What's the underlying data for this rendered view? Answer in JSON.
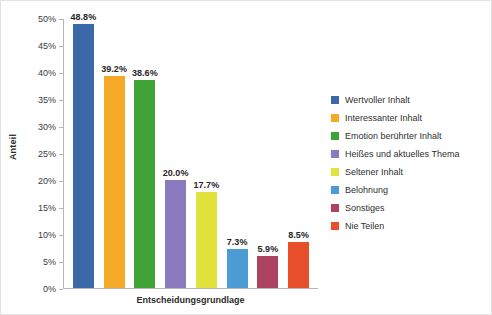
{
  "chart_data": {
    "type": "bar",
    "title": "",
    "xlabel": "Entscheidungsgrundlage",
    "ylabel": "Anteil",
    "ylim": [
      0,
      50
    ],
    "grid": false,
    "legend_position": "right",
    "ytick_labels": [
      "50%",
      "45%",
      "40%",
      "35%",
      "30%",
      "25%",
      "20%",
      "15%",
      "10%",
      "5%",
      "0%"
    ],
    "ytick_values": [
      50,
      45,
      40,
      35,
      30,
      25,
      20,
      15,
      10,
      5,
      0
    ],
    "categories": [
      "Wertvoller Inhalt",
      "Interessanter Inhalt",
      "Emotion berührter Inhalt",
      "Heißes und aktuelles Thema",
      "Seltener Inhalt",
      "Belohnung",
      "Sonstiges",
      "Nie Teilen"
    ],
    "values": [
      48.8,
      39.2,
      38.6,
      20.0,
      17.7,
      7.3,
      5.9,
      8.5
    ],
    "data_labels": [
      "48.8%",
      "39.2%",
      "38.6%",
      "20.0%",
      "17.7%",
      "7.3%",
      "5.9%",
      "8.5%"
    ],
    "colors": [
      "#3a68a8",
      "#f5a928",
      "#3fa336",
      "#8a7bbf",
      "#e2e23c",
      "#4b9bd5",
      "#ae4361",
      "#e8502b"
    ]
  },
  "legend": {
    "items": [
      {
        "label": "Wertvoller Inhalt",
        "color": "#3a68a8"
      },
      {
        "label": "Interessanter Inhalt",
        "color": "#f5a928"
      },
      {
        "label": "Emotion berührter Inhalt",
        "color": "#3fa336"
      },
      {
        "label": "Heißes und aktuelles Thema",
        "color": "#8a7bbf"
      },
      {
        "label": "Seltener Inhalt",
        "color": "#e2e23c"
      },
      {
        "label": "Belohnung",
        "color": "#4b9bd5"
      },
      {
        "label": "Sonstiges",
        "color": "#ae4361"
      },
      {
        "label": "Nie Teilen",
        "color": "#e8502b"
      }
    ]
  }
}
